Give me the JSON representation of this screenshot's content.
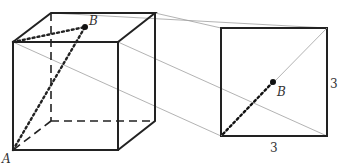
{
  "figure": {
    "cube": {
      "vertex_label_A": "A",
      "point_label_B": "B"
    },
    "square": {
      "point_label_B": "B",
      "side_right_label": "3",
      "side_bottom_label": "3"
    }
  },
  "colors": {
    "stroke": "#222222",
    "thin": "#999999"
  }
}
